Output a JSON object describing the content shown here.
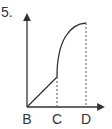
{
  "question_number": "5.",
  "diagram": {
    "type": "graph-sketch",
    "axes": {
      "x_arrow": true,
      "y_arrow": true
    },
    "points": [
      {
        "label": "B",
        "role": "origin"
      },
      {
        "label": "C",
        "role": "x-marker"
      },
      {
        "label": "D",
        "role": "x-marker"
      }
    ],
    "segments": [
      {
        "from": "B",
        "to": "C",
        "shape": "straight line increasing"
      },
      {
        "from": "C",
        "to": "D",
        "shape": "concave curve increasing, leveling off"
      }
    ],
    "guides": [
      "dashed vertical at C",
      "dashed vertical at D"
    ],
    "line_color": "#333333"
  }
}
